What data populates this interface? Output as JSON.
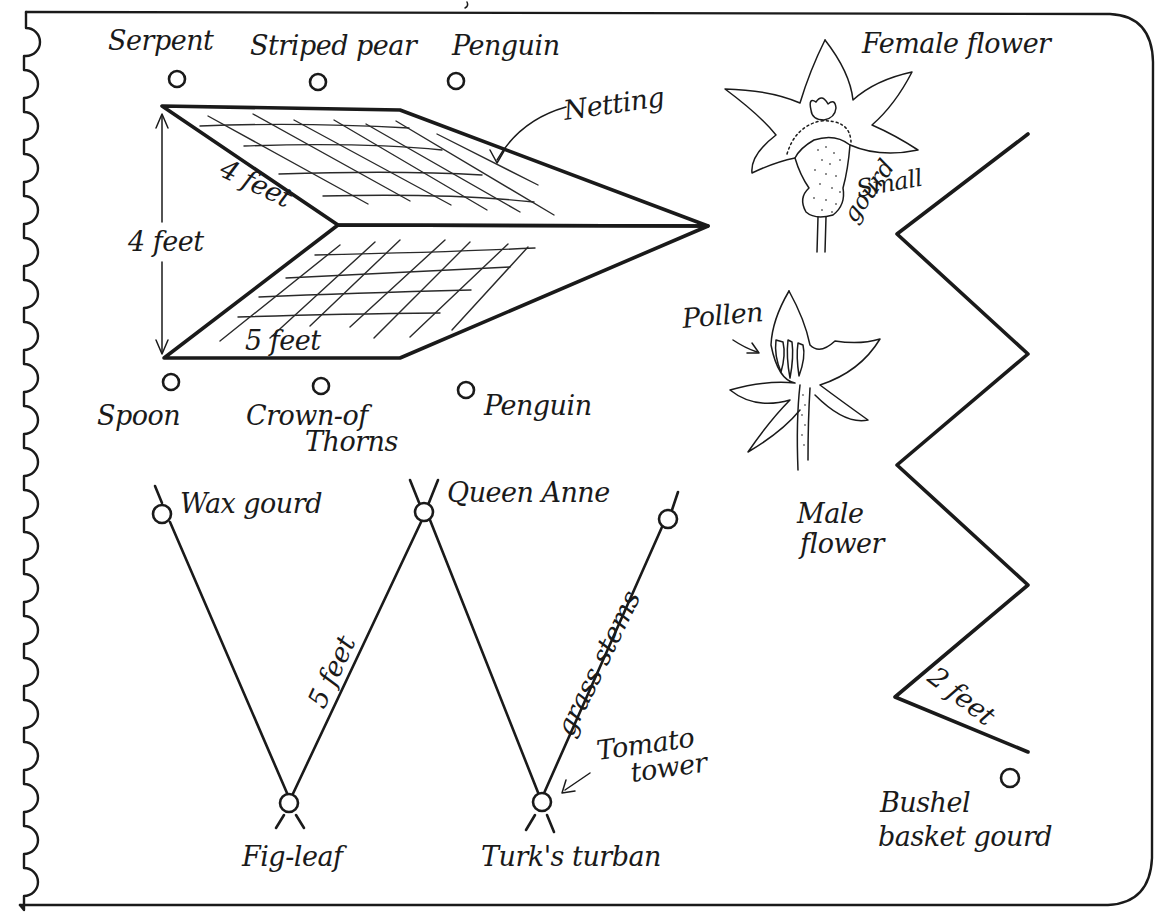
{
  "diagram": {
    "page_style": "spiral notebook page with scalloped left binding edge",
    "colors": {
      "ink": "#1a1a1a",
      "paper": "#ffffff"
    },
    "a_frame_trellis": {
      "top_labels": [
        "Serpent",
        "Striped pear",
        "Penguin"
      ],
      "bottom_labels": [
        "Spoon",
        "Crown-of",
        "Thorns",
        "Penguin"
      ],
      "netting_label": "Netting",
      "dimension_height": "4 feet",
      "dimension_depth": "4 feet",
      "dimension_length": "5 feet"
    },
    "female_flower": {
      "label": "Female flower",
      "callout": [
        "Small",
        "gourd"
      ]
    },
    "male_flower": {
      "label": [
        "Male",
        "flower"
      ],
      "callout": "Pollen"
    },
    "w_trellis": {
      "top_labels": [
        "Wax gourd",
        "Queen Anne"
      ],
      "bottom_labels": [
        "Fig-leaf",
        "Turk's turban"
      ],
      "side_dimension": "5 feet",
      "material_label": "grass stems",
      "callout": [
        "Tomato",
        "tower"
      ]
    },
    "zigzag_fence": {
      "dimension": "2 feet",
      "label": [
        "Bushel",
        "basket gourd"
      ]
    }
  }
}
